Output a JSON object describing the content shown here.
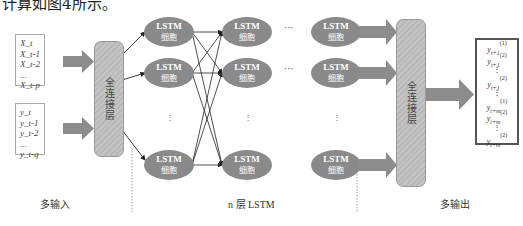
{
  "caption": {
    "top_partial": "计算如图4所示。"
  },
  "inputs": {
    "x_series": [
      "X_t",
      "X_t-1",
      "X_t-2",
      "...",
      "X_t-p"
    ],
    "y_series": [
      "y_t",
      "y_t-1",
      "y_t-2",
      "...",
      "y_t-q"
    ],
    "label": "多输入"
  },
  "fc_layer_in": {
    "label": "全连接层"
  },
  "lstm": {
    "cell_title": "LSTM",
    "cell_subtitle": "细胞",
    "layer_label": "n 层 LSTM",
    "columns": 3,
    "rows_visible": 3,
    "hdots": "···",
    "vdots": "⋮"
  },
  "fc_layer_out": {
    "label": "全连接层"
  },
  "outputs": {
    "items": [
      {
        "base": "y",
        "sub": "t+1",
        "sup": "(1)"
      },
      {
        "base": "y",
        "sub": "t+1",
        "sup": "(2)"
      },
      {
        "base": "⋮",
        "sub": "",
        "sup": ""
      },
      {
        "base": "y",
        "sub": "t+1",
        "sup": "(2)"
      },
      {
        "base": "⋮",
        "sub": "",
        "sup": ""
      },
      {
        "base": "y",
        "sub": "t+m",
        "sup": "(1)"
      },
      {
        "base": "y",
        "sub": "t+m",
        "sup": "(2)"
      },
      {
        "base": "⋮",
        "sub": "",
        "sup": ""
      },
      {
        "base": "y",
        "sub": "t+m",
        "sup": "(2)"
      }
    ],
    "label": "多输出"
  },
  "colors": {
    "cell_fill": "#8a8a8a",
    "arrow_fill": "#8c8c8c",
    "fc_fill": "#c0c0c0",
    "line": "#222222"
  }
}
